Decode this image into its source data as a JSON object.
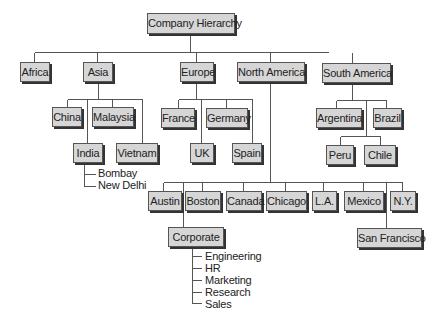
{
  "diagram": {
    "type": "org-chart",
    "root": {
      "id": "root",
      "label": "Company Hierarchy",
      "box": [
        147,
        13,
        86,
        19
      ]
    },
    "nodes": [
      {
        "id": "africa",
        "label": "Africa",
        "parent": "root",
        "box": [
          20,
          62,
          28,
          18
        ]
      },
      {
        "id": "asia",
        "label": "Asia",
        "parent": "root",
        "box": [
          83,
          62,
          28,
          18
        ]
      },
      {
        "id": "europe",
        "label": "Europe",
        "parent": "root",
        "box": [
          180,
          62,
          32,
          18
        ]
      },
      {
        "id": "north-america",
        "label": "North America",
        "parent": "root",
        "box": [
          237,
          62,
          66,
          18
        ]
      },
      {
        "id": "south-america",
        "label": "South America",
        "parent": "root",
        "box": [
          322,
          63,
          67,
          18
        ]
      },
      {
        "id": "china",
        "label": "China",
        "parent": "asia",
        "box": [
          52,
          107,
          28,
          18
        ]
      },
      {
        "id": "malaysia",
        "label": "Malaysia",
        "parent": "asia",
        "box": [
          92,
          107,
          40,
          18
        ]
      },
      {
        "id": "india",
        "label": "India",
        "parent": "asia",
        "box": [
          73,
          143,
          28,
          18
        ]
      },
      {
        "id": "vietnam",
        "label": "Vietnam",
        "parent": "asia",
        "box": [
          116,
          143,
          40,
          18
        ]
      },
      {
        "id": "france",
        "label": "France",
        "parent": "europe",
        "box": [
          161,
          108,
          32,
          18
        ]
      },
      {
        "id": "germany",
        "label": "Germany",
        "parent": "europe",
        "box": [
          206,
          108,
          40,
          18
        ]
      },
      {
        "id": "uk",
        "label": "UK",
        "parent": "europe",
        "box": [
          190,
          143,
          22,
          18
        ]
      },
      {
        "id": "spain",
        "label": "Spain",
        "parent": "europe",
        "box": [
          232,
          143,
          28,
          18
        ]
      },
      {
        "id": "argentina",
        "label": "Argentina",
        "parent": "south-america",
        "box": [
          316,
          108,
          44,
          18
        ]
      },
      {
        "id": "brazil",
        "label": "Brazil",
        "parent": "south-america",
        "box": [
          373,
          108,
          27,
          18
        ]
      },
      {
        "id": "peru",
        "label": "Peru",
        "parent": "south-america",
        "box": [
          326,
          145,
          26,
          18
        ]
      },
      {
        "id": "chile",
        "label": "Chile",
        "parent": "south-america",
        "box": [
          364,
          145,
          30,
          18
        ]
      },
      {
        "id": "austin",
        "label": "Austin",
        "parent": "north-america",
        "box": [
          148,
          191,
          32,
          18
        ]
      },
      {
        "id": "boston",
        "label": "Boston",
        "parent": "north-america",
        "box": [
          185,
          191,
          34,
          18
        ]
      },
      {
        "id": "canada",
        "label": "Canada",
        "parent": "north-america",
        "box": [
          226,
          191,
          34,
          18
        ]
      },
      {
        "id": "chicago",
        "label": "Chicago",
        "parent": "north-america",
        "box": [
          266,
          191,
          39,
          18
        ]
      },
      {
        "id": "la",
        "label": "L.A.",
        "parent": "north-america",
        "box": [
          312,
          191,
          23,
          18
        ]
      },
      {
        "id": "mexico",
        "label": "Mexico",
        "parent": "north-america",
        "box": [
          344,
          191,
          38,
          18
        ]
      },
      {
        "id": "ny",
        "label": "N.Y.",
        "parent": "north-america",
        "box": [
          390,
          191,
          24,
          18
        ]
      },
      {
        "id": "corporate",
        "label": "Corporate",
        "parent": "north-america",
        "box": [
          168,
          227,
          54,
          18
        ]
      },
      {
        "id": "san-francisco",
        "label": "San Francisco",
        "parent": "north-america",
        "box": [
          357,
          228,
          63,
          18
        ]
      }
    ],
    "leaf_lists": [
      {
        "parent": "india",
        "x": 98,
        "y": 167,
        "items": [
          "Bombay",
          "New Delhi"
        ]
      },
      {
        "parent": "corporate",
        "x": 205,
        "y": 250,
        "items": [
          "Engineering",
          "HR",
          "Marketing",
          "Research",
          "Sales"
        ]
      }
    ],
    "connectors": [
      [
        190,
        33,
        190,
        52
      ],
      [
        34,
        52,
        328,
        52
      ],
      [
        34,
        52,
        34,
        62
      ],
      [
        97,
        52,
        97,
        62
      ],
      [
        196,
        52,
        196,
        62
      ],
      [
        270,
        52,
        270,
        62
      ],
      [
        352,
        52,
        352,
        63
      ],
      [
        98,
        80,
        98,
        99
      ],
      [
        67,
        99,
        142,
        99
      ],
      [
        67,
        99,
        67,
        107
      ],
      [
        112,
        99,
        112,
        107
      ],
      [
        87,
        99,
        87,
        143
      ],
      [
        142,
        99,
        142,
        143
      ],
      [
        84,
        161,
        84,
        186
      ],
      [
        84,
        174,
        95,
        174
      ],
      [
        84,
        186,
        95,
        186
      ],
      [
        196,
        80,
        196,
        99
      ],
      [
        178,
        99,
        252,
        99
      ],
      [
        178,
        99,
        178,
        108
      ],
      [
        226,
        99,
        226,
        108
      ],
      [
        201,
        99,
        201,
        143
      ],
      [
        252,
        99,
        252,
        143
      ],
      [
        352,
        81,
        352,
        100
      ],
      [
        336,
        100,
        386,
        100
      ],
      [
        336,
        100,
        336,
        108
      ],
      [
        386,
        100,
        386,
        108
      ],
      [
        366,
        100,
        366,
        136
      ],
      [
        340,
        136,
        380,
        136
      ],
      [
        340,
        136,
        340,
        145
      ],
      [
        380,
        136,
        380,
        145
      ],
      [
        270,
        80,
        270,
        182
      ],
      [
        163,
        182,
        402,
        182
      ],
      [
        163,
        182,
        163,
        191
      ],
      [
        202,
        182,
        202,
        191
      ],
      [
        243,
        182,
        243,
        191
      ],
      [
        285,
        182,
        285,
        191
      ],
      [
        323,
        182,
        323,
        191
      ],
      [
        363,
        182,
        363,
        191
      ],
      [
        402,
        182,
        402,
        191
      ],
      [
        183,
        182,
        183,
        227
      ],
      [
        386,
        182,
        386,
        228
      ],
      [
        192,
        245,
        192,
        303
      ],
      [
        192,
        256,
        201,
        256
      ],
      [
        192,
        268,
        201,
        268
      ],
      [
        192,
        280,
        201,
        280
      ],
      [
        192,
        292,
        201,
        292
      ],
      [
        192,
        303,
        201,
        303
      ]
    ]
  },
  "colors": {
    "node_fill": "#d6d6d6",
    "node_border": "#555555",
    "node_shadow": "#333333",
    "connector": "#555555",
    "text": "#222222",
    "background": "#ffffff"
  }
}
